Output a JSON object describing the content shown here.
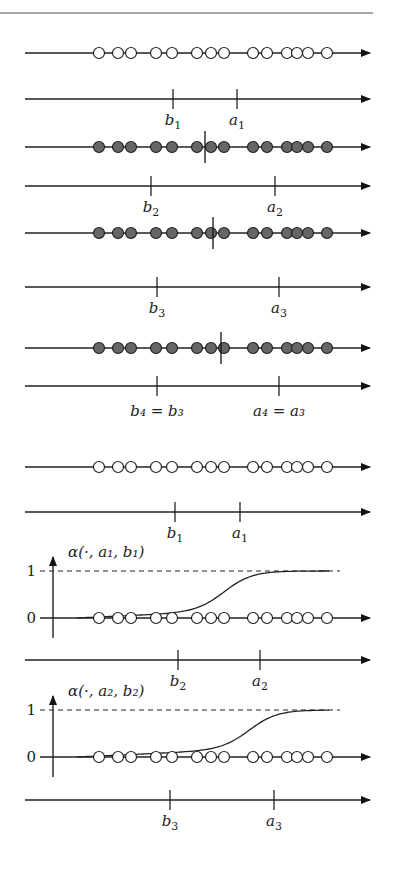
{
  "header": {
    "rule_color": "#888888"
  },
  "colors": {
    "line": "#222222",
    "filled_point": "#666666",
    "open_point": "#ffffff"
  },
  "points_x": [
    99,
    118,
    131,
    156,
    172,
    197,
    211,
    224,
    253,
    267,
    287,
    297,
    308,
    327
  ],
  "rows": [
    {
      "id": "row1-points",
      "type": "points",
      "y": 53,
      "fill": "open",
      "cut": null
    },
    {
      "id": "row1-axis",
      "type": "axis",
      "y": 99,
      "ticks": [
        {
          "x": 173,
          "label": "b",
          "sub": "1"
        },
        {
          "x": 237,
          "label": "a",
          "sub": "1"
        }
      ],
      "label_below": true
    },
    {
      "id": "row2-points",
      "type": "points",
      "y": 147,
      "fill": "filled",
      "cut": 205
    },
    {
      "id": "row2-axis",
      "type": "axis",
      "y": 186,
      "ticks": [
        {
          "x": 151,
          "label": "b",
          "sub": "2"
        },
        {
          "x": 275,
          "label": "a",
          "sub": "2"
        }
      ],
      "label_below": true
    },
    {
      "id": "row3-points",
      "type": "points",
      "y": 233,
      "fill": "filled",
      "cut": 213
    },
    {
      "id": "row3-axis",
      "type": "axis",
      "y": 287,
      "ticks": [
        {
          "x": 157,
          "label": "b",
          "sub": "3"
        },
        {
          "x": 279,
          "label": "a",
          "sub": "3"
        }
      ],
      "label_below": true
    },
    {
      "id": "row4-points",
      "type": "points",
      "y": 348,
      "fill": "filled",
      "cut": 221
    },
    {
      "id": "row4-axis",
      "type": "axis",
      "y": 386,
      "ticks": [
        {
          "x": 157,
          "label": "b₄ = b₃",
          "sub": ""
        },
        {
          "x": 279,
          "label": "a₄ = a₃",
          "sub": ""
        }
      ],
      "label_below": true
    },
    {
      "id": "row5-points",
      "type": "points",
      "y": 467,
      "fill": "open",
      "cut": null
    },
    {
      "id": "row5-axis",
      "type": "axis",
      "y": 512,
      "ticks": [
        {
          "x": 175,
          "label": "b",
          "sub": "1"
        },
        {
          "x": 240,
          "label": "a",
          "sub": "1"
        }
      ],
      "label_below": true
    },
    {
      "id": "row6-plot",
      "type": "sigmoid",
      "y0": 618,
      "y1": 571,
      "title": "α(·, a₁, b₁)",
      "center": 200
    },
    {
      "id": "row6-axis",
      "type": "axis",
      "y": 660,
      "ticks": [
        {
          "x": 178,
          "label": "b",
          "sub": "2"
        },
        {
          "x": 260,
          "label": "a",
          "sub": "2"
        }
      ],
      "label_below": true
    },
    {
      "id": "row7-plot",
      "type": "sigmoid",
      "y0": 757,
      "y1": 710,
      "title": "α(·, a₂, b₂)",
      "center": 225
    },
    {
      "id": "row7-axis",
      "type": "axis",
      "y": 800,
      "ticks": [
        {
          "x": 170,
          "label": "b",
          "sub": "3"
        },
        {
          "x": 274,
          "label": "a",
          "sub": "3"
        }
      ],
      "label_below": true
    }
  ],
  "plot_labels": {
    "one": "1",
    "zero": "0"
  }
}
